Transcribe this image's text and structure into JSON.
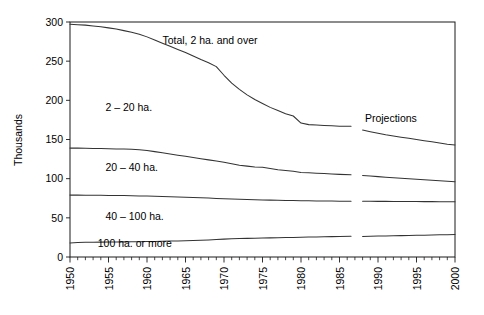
{
  "chart_data": {
    "type": "line",
    "title": "",
    "subtitle": "",
    "xlabel": "",
    "ylabel": "Thousands",
    "xlim": [
      1950,
      2000
    ],
    "ylim": [
      0,
      300
    ],
    "grid": false,
    "legend_position": "inline-annotations",
    "y_ticks": [
      0,
      50,
      100,
      150,
      200,
      250,
      300
    ],
    "y_tick_labels": [
      "0",
      "50",
      "100",
      "150",
      "200",
      "250",
      "300"
    ],
    "x_ticks": [
      1950,
      1955,
      1960,
      1965,
      1970,
      1975,
      1980,
      1985,
      1990,
      1995,
      2000
    ],
    "x_tick_labels": [
      "1950",
      "1955",
      "1960",
      "1965",
      "1970",
      "1975",
      "1980",
      "1985",
      "1990",
      "1995",
      "2000"
    ],
    "x_minor_tick_interval": 1,
    "projection_break": {
      "history_end": 1986.5,
      "projection_start": 1988.0
    },
    "annotations": [
      {
        "name": "total-label",
        "text": "Total, 2 ha. and over",
        "x": 1962.0,
        "y": 272
      },
      {
        "name": "band-2-20-label",
        "text": "2 – 20 ha.",
        "x": 1954.6,
        "y": 186
      },
      {
        "name": "band-20-40-label",
        "text": "20 – 40 ha.",
        "x": 1954.6,
        "y": 110
      },
      {
        "name": "band-40-100-label",
        "text": "40 – 100 ha.",
        "x": 1954.6,
        "y": 47
      },
      {
        "name": "band-100-label",
        "text": "100 ha. or more",
        "x": 1953.6,
        "y": 13
      },
      {
        "name": "projections-label",
        "text": "Projections",
        "x": 1988.3,
        "y": 172
      }
    ],
    "series": [
      {
        "name": "Total, 2 ha. and over",
        "id": "total-2ha-and-over",
        "x": [
          1950,
          1951,
          1952,
          1953,
          1954,
          1955,
          1956,
          1957,
          1958,
          1959,
          1960,
          1961,
          1962,
          1963,
          1964,
          1965,
          1966,
          1967,
          1968,
          1969,
          1970,
          1971,
          1972,
          1973,
          1974,
          1975,
          1976,
          1977,
          1978,
          1979,
          1980,
          1981,
          1982,
          1983,
          1984,
          1985,
          1986.5
        ],
        "values": [
          297,
          296.5,
          296,
          295,
          294,
          292.5,
          291,
          289,
          287,
          284.5,
          281,
          277,
          273,
          269,
          265,
          261,
          256.5,
          252,
          248,
          243,
          232,
          222,
          214,
          207,
          201,
          196,
          191,
          187,
          183,
          180,
          171,
          169,
          168.5,
          168,
          167.5,
          167,
          167
        ],
        "projection_x": [
          1988,
          1989,
          1990,
          1991,
          1992,
          1993,
          1994,
          1995,
          1996,
          1997,
          1998,
          1999,
          2000
        ],
        "projection_values": [
          162,
          160,
          158,
          156,
          154.5,
          153,
          151.5,
          150,
          148.5,
          147,
          145.5,
          144,
          143
        ]
      },
      {
        "name": "20 ha. and over (upper bound of 20–40 band)",
        "id": "boundary-20ha-and-over",
        "x": [
          1950,
          1951,
          1952,
          1953,
          1954,
          1955,
          1956,
          1957,
          1958,
          1959,
          1960,
          1961,
          1962,
          1963,
          1964,
          1965,
          1966,
          1967,
          1968,
          1969,
          1970,
          1971,
          1972,
          1973,
          1974,
          1975,
          1976,
          1977,
          1978,
          1979,
          1980,
          1981,
          1982,
          1983,
          1984,
          1985,
          1986.5
        ],
        "values": [
          139,
          139,
          138.8,
          138.6,
          138.4,
          138.2,
          138,
          137.8,
          137.5,
          137,
          136,
          134.5,
          133,
          131.5,
          130,
          128.5,
          127,
          125.5,
          124,
          122.5,
          121,
          119,
          117,
          116,
          115,
          114.5,
          113,
          111.5,
          110.5,
          109.5,
          108,
          107.5,
          107,
          106.5,
          106,
          105.5,
          105
        ],
        "projection_x": [
          1988,
          1989,
          1990,
          1991,
          1992,
          1993,
          1994,
          1995,
          1996,
          1997,
          1998,
          1999,
          2000
        ],
        "projection_values": [
          104,
          103.3,
          102.6,
          101.9,
          101.2,
          100.5,
          99.8,
          99.2,
          98.6,
          98,
          97.4,
          96.8,
          96
        ]
      },
      {
        "name": "40 ha. and over (upper bound of 40–100 band)",
        "id": "boundary-40ha-and-over",
        "x": [
          1950,
          1951,
          1952,
          1953,
          1954,
          1955,
          1956,
          1957,
          1958,
          1959,
          1960,
          1961,
          1962,
          1963,
          1964,
          1965,
          1966,
          1967,
          1968,
          1969,
          1970,
          1971,
          1972,
          1973,
          1974,
          1975,
          1976,
          1977,
          1978,
          1979,
          1980,
          1981,
          1982,
          1983,
          1984,
          1985,
          1986.5
        ],
        "values": [
          79,
          79,
          78.9,
          78.8,
          78.7,
          78.6,
          78.5,
          78.4,
          78.2,
          78,
          77.8,
          77.5,
          77.2,
          76.9,
          76.6,
          76.3,
          76,
          75.6,
          75.2,
          74.8,
          74.4,
          74,
          73.6,
          73.3,
          73,
          72.8,
          72.6,
          72.4,
          72.2,
          72,
          71.8,
          71.7,
          71.6,
          71.5,
          71.4,
          71.3,
          71.2
        ],
        "projection_x": [
          1988,
          1989,
          1990,
          1991,
          1992,
          1993,
          1994,
          1995,
          1996,
          1997,
          1998,
          1999,
          2000
        ],
        "projection_values": [
          71.2,
          71.1,
          71,
          71,
          70.9,
          70.9,
          70.8,
          70.8,
          70.7,
          70.7,
          70.6,
          70.6,
          70.5
        ]
      },
      {
        "name": "100 ha. or more",
        "id": "boundary-100ha-or-more",
        "x": [
          1950,
          1951,
          1952,
          1953,
          1954,
          1955,
          1956,
          1957,
          1958,
          1959,
          1960,
          1961,
          1962,
          1963,
          1964,
          1965,
          1966,
          1967,
          1968,
          1969,
          1970,
          1971,
          1972,
          1973,
          1974,
          1975,
          1976,
          1977,
          1978,
          1979,
          1980,
          1981,
          1982,
          1983,
          1984,
          1985,
          1986.5
        ],
        "values": [
          18,
          18.6,
          18.8,
          18.9,
          19,
          19.1,
          19.2,
          19.3,
          19.4,
          19.5,
          19.7,
          19.9,
          20.1,
          20.3,
          20.5,
          20.8,
          21.1,
          21.4,
          21.8,
          22.3,
          22.8,
          23.2,
          23.5,
          23.8,
          24,
          24.2,
          24.4,
          24.6,
          24.8,
          25,
          25.2,
          25.4,
          25.6,
          25.8,
          26,
          26.2,
          26.4
        ],
        "projection_x": [
          1988,
          1989,
          1990,
          1991,
          1992,
          1993,
          1994,
          1995,
          1996,
          1997,
          1998,
          1999,
          2000
        ],
        "projection_values": [
          26.3,
          26.5,
          26.7,
          26.9,
          27.1,
          27.3,
          27.5,
          27.7,
          27.9,
          28.1,
          28.3,
          28.5,
          28.7
        ]
      }
    ]
  },
  "axes": {
    "y_axis_title": "Thousands"
  }
}
